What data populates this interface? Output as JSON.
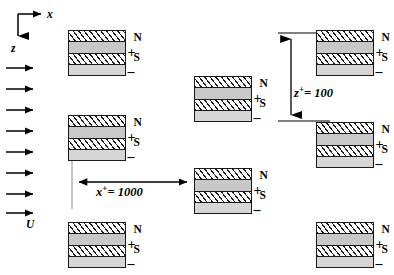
{
  "figure": {
    "type": "schematic-diagram"
  },
  "axes": {
    "x_label": "x",
    "z_label": "z",
    "origin": {
      "x": 18,
      "y": 14
    },
    "x_arrow_end": {
      "x": 45,
      "y": 14
    },
    "z_arrow_end": {
      "x": 18,
      "y": 40
    }
  },
  "flow": {
    "label": "U",
    "arrow_count": 8,
    "arrow_x_start": 6,
    "arrow_x_end": 38,
    "arrow_y_positions": [
      68,
      89,
      110,
      131,
      152,
      173,
      194,
      213
    ],
    "label_position": {
      "x": 26,
      "y": 222
    }
  },
  "dimensions": [
    {
      "name": "streamwise-spacing",
      "label_html": "x<sup>+</sup>= 1000",
      "symbol": "x+",
      "value": 1000,
      "orientation": "horizontal",
      "from": {
        "x": 72,
        "y": 182
      },
      "to": {
        "x": 194,
        "y": 182
      },
      "text_position": {
        "x": 96,
        "y": 191
      },
      "guide_line": {
        "x": 72,
        "y1": 157,
        "y2": 209
      }
    },
    {
      "name": "wall-normal-spacing",
      "label_html": "z<sup>+</sup>= 100",
      "symbol": "z+",
      "value": 100,
      "orientation": "vertical",
      "from": {
        "x": 291,
        "y": 33
      },
      "to": {
        "x": 291,
        "y": 121
      },
      "text_position": {
        "x": 278,
        "y": 93
      },
      "tick_top": {
        "x1": 278,
        "x2": 330,
        "y": 33
      },
      "tick_bottom": {
        "x1": 278,
        "x2": 330,
        "y": 121
      }
    }
  ],
  "magnet": {
    "width": 58,
    "height": 46,
    "layers": [
      {
        "name": "magnet-layer-north-electrode",
        "style": "hatch"
      },
      {
        "name": "magnet-layer-upper-gap",
        "style": "gray"
      },
      {
        "name": "magnet-layer-south-electrode",
        "style": "hatch"
      },
      {
        "name": "magnet-layer-lower-gap",
        "style": "gray2"
      }
    ],
    "labels": {
      "north": "N",
      "south": "S",
      "positive": "+",
      "negative": "–"
    }
  },
  "blocks": [
    {
      "name": "magnet-top-left",
      "x": 68,
      "y": 30
    },
    {
      "name": "magnet-mid-left",
      "x": 68,
      "y": 115
    },
    {
      "name": "magnet-bottom-left",
      "x": 68,
      "y": 222
    },
    {
      "name": "magnet-center-upper",
      "x": 194,
      "y": 76
    },
    {
      "name": "magnet-center-lower",
      "x": 194,
      "y": 168
    },
    {
      "name": "magnet-top-right",
      "x": 316,
      "y": 30
    },
    {
      "name": "magnet-mid-right",
      "x": 316,
      "y": 122
    },
    {
      "name": "magnet-bottom-right",
      "x": 316,
      "y": 222
    }
  ]
}
